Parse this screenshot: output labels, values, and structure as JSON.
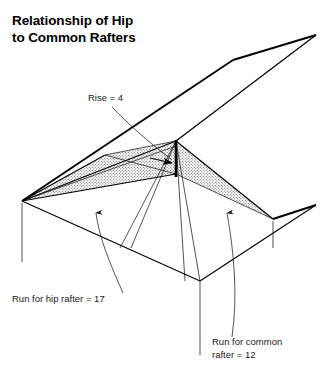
{
  "figure": {
    "width": 335,
    "height": 378,
    "background": "#ffffff",
    "line_color": "#000000",
    "shade_color": "#8c8c8c"
  },
  "title": {
    "line1": "Relationship of Hip",
    "line2": "to Common Rafters"
  },
  "annotations": {
    "rise": {
      "text": "Rise = 4",
      "value": 4,
      "quantity": "Rise"
    },
    "hip_run": {
      "text": "Run for hip rafter = 17",
      "value": 17,
      "quantity": "Run for hip rafter"
    },
    "common_run": {
      "line1": "Run for common",
      "line2": "rafter = 12",
      "value": 12,
      "quantity": "Run for common rafter"
    }
  },
  "diagram": {
    "type": "isometric-roof-framing",
    "shaded_region": "hip-rafter-triangle",
    "elements": [
      "ridge-line",
      "hip-rafter",
      "common-rafter",
      "rise-vertical",
      "eave-lines",
      "wall-corner-drops"
    ]
  }
}
